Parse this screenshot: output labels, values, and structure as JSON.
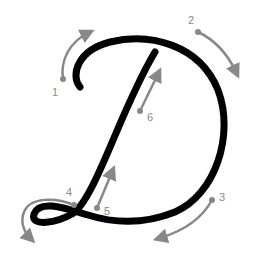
{
  "letter": "D",
  "colors": {
    "stroke": "#000000",
    "guide": "#888888",
    "label": "#8a8a8a",
    "background": "#ffffff"
  },
  "steps": [
    {
      "number": "1"
    },
    {
      "number": "2"
    },
    {
      "number": "3"
    },
    {
      "number": "4"
    },
    {
      "number": "5"
    },
    {
      "number": "6"
    }
  ]
}
